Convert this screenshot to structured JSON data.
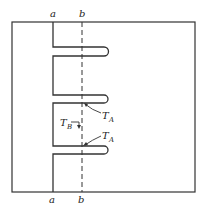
{
  "diagram": {
    "type": "fin-cross-section",
    "labels": {
      "top_a": "a",
      "top_b": "b",
      "bottom_a": "a",
      "bottom_b": "b"
    },
    "annotations": [
      {
        "id": "ta1",
        "main": "T",
        "sub": "A"
      },
      {
        "id": "tb",
        "main": "T",
        "sub": "B"
      },
      {
        "id": "ta2",
        "main": "T",
        "sub": "A"
      }
    ],
    "fin_count": 3,
    "line_color": "#333333",
    "background": "#ffffff"
  }
}
